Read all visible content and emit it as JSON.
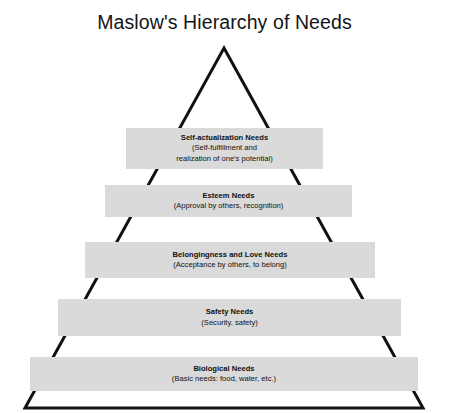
{
  "title": "Maslow's Hierarchy of Needs",
  "colors": {
    "bar_fill": "#dadada",
    "outline": "#111111",
    "background": "#ffffff",
    "text": "#111111"
  },
  "pyramid": {
    "apex": {
      "x": 224,
      "y": 48
    },
    "base_left": {
      "x": 25,
      "y": 408
    },
    "base_right": {
      "x": 423,
      "y": 408
    },
    "stroke_width": 3
  },
  "tiers": [
    {
      "level": 5,
      "position": "top",
      "name": "Self-actualization Needs",
      "lines": [
        "Self-actualization Needs",
        "(Self-fulfillment and",
        "realization of one's potential)"
      ]
    },
    {
      "level": 4,
      "position": "second",
      "name": "Esteem Needs",
      "lines": [
        "Esteem Needs",
        "(Approval by others, recognition)"
      ]
    },
    {
      "level": 3,
      "position": "middle",
      "name": "Belongingness and Love Needs",
      "lines": [
        "Belongingness and Love Needs",
        "(Acceptance by others, to belong)"
      ]
    },
    {
      "level": 2,
      "position": "fourth",
      "name": "Safety Needs",
      "lines": [
        "Safety Needs",
        "(Security, safety)"
      ]
    },
    {
      "level": 1,
      "position": "bottom",
      "name": "Biological Needs",
      "lines": [
        "Biological Needs",
        "(Basic needs: food, water, etc.)"
      ]
    }
  ]
}
